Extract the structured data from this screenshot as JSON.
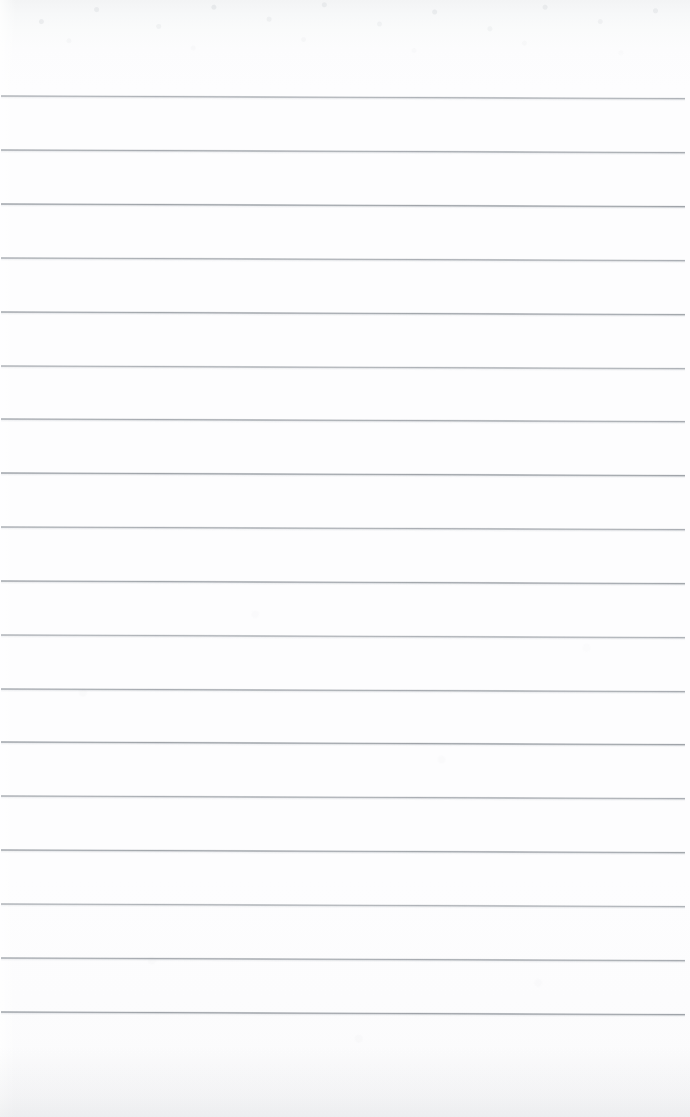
{
  "document": {
    "kind": "scanned-lined-notebook-page",
    "title": "Blank Ruled Notebook Page",
    "orientation": "portrait",
    "width_px": 690,
    "height_px": 1117,
    "has_text_content": false,
    "has_handwriting": false,
    "visible_text": ""
  },
  "paper": {
    "background_color": "#fdfdfe",
    "top_band_color": "#f3f4f5",
    "edge_shadow_color": "#bcc0c6",
    "texture": "faint mottled scan grain, strongest across the top margin"
  },
  "ruling": {
    "line_color": "#969ba1",
    "line_color_light": "#b2b6bb",
    "line_thickness_px": 2,
    "line_count": 18,
    "spacing_px": 54,
    "first_line_y": 95,
    "last_line_y": 1013,
    "left_x": 1,
    "right_x": 685,
    "skew_degrees": 0.22,
    "top_margin_px": 95,
    "bottom_margin_px": 104,
    "lines_y": [
      95,
      149,
      203,
      257,
      311,
      365,
      418,
      472,
      526,
      580,
      634,
      688,
      741,
      795,
      849,
      903,
      957,
      1011
    ]
  }
}
